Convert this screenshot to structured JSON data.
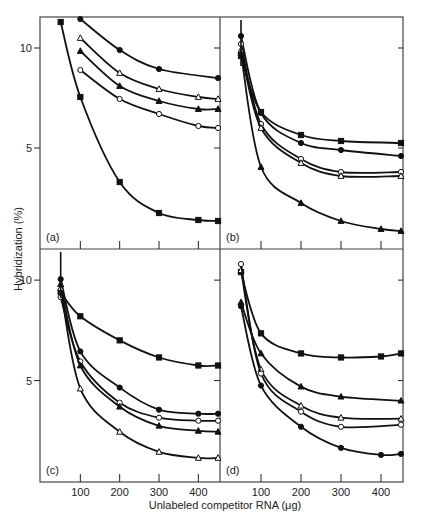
{
  "chart_data": {
    "type": "line",
    "title": "",
    "xlabel": "Unlabeled competitor  RNA (μg)",
    "ylabel": "Hybridization (%)",
    "xlim": [
      0,
      455
    ],
    "ylim": [
      0,
      11.5
    ],
    "xticks": [
      100,
      200,
      300,
      400
    ],
    "xtick_labels": [
      "100",
      "200",
      "300",
      "400"
    ],
    "yticks": [
      5,
      10
    ],
    "ytick_labels": [
      "5",
      "10"
    ],
    "grid": false,
    "legend": "none",
    "panels": [
      {
        "label": "(a)",
        "series": [
          {
            "marker": "filled-square",
            "x": [
              50,
              100,
              200,
              300,
              400,
              450
            ],
            "y": [
              11.3,
              7.55,
              3.3,
              1.75,
              1.4,
              1.35
            ]
          },
          {
            "marker": "filled-circle",
            "x": [
              100,
              200,
              300,
              450
            ],
            "y": [
              11.45,
              9.9,
              8.95,
              8.5
            ]
          },
          {
            "marker": "open-triangle",
            "x": [
              100,
              200,
              300,
              400,
              450
            ],
            "y": [
              10.5,
              8.75,
              7.95,
              7.55,
              7.45
            ]
          },
          {
            "marker": "filled-triangle",
            "x": [
              100,
              200,
              300,
              400,
              450
            ],
            "y": [
              9.85,
              8.1,
              7.35,
              6.95,
              6.95
            ]
          },
          {
            "marker": "open-circle",
            "x": [
              100,
              200,
              300,
              400,
              450
            ],
            "y": [
              8.9,
              7.45,
              6.7,
              6.1,
              6.0
            ]
          }
        ]
      },
      {
        "label": "(b)",
        "series": [
          {
            "marker": "filled-square",
            "x": [
              50,
              100,
              200,
              300,
              450
            ],
            "y": [
              9.6,
              6.8,
              5.65,
              5.35,
              5.25
            ]
          },
          {
            "marker": "filled-circle",
            "x": [
              50,
              100,
              200,
              300,
              450
            ],
            "y": [
              10.6,
              6.75,
              5.25,
              4.9,
              4.6
            ]
          },
          {
            "marker": "open-circle",
            "x": [
              50,
              100,
              200,
              300,
              450
            ],
            "y": [
              10.2,
              6.2,
              4.45,
              3.8,
              3.8
            ]
          },
          {
            "marker": "open-triangle",
            "x": [
              50,
              100,
              200,
              300,
              450
            ],
            "y": [
              9.9,
              6.0,
              4.25,
              3.6,
              3.6
            ]
          },
          {
            "marker": "filled-triangle",
            "x": [
              50,
              100,
              200,
              300,
              400,
              450
            ],
            "y": [
              9.75,
              4.05,
              2.25,
              1.35,
              0.95,
              0.85
            ]
          }
        ]
      },
      {
        "label": "(c)",
        "series": [
          {
            "marker": "filled-square",
            "x": [
              50,
              100,
              200,
              300,
              400,
              450
            ],
            "y": [
              9.4,
              8.2,
              7.0,
              6.15,
              5.75,
              5.75
            ]
          },
          {
            "marker": "filled-circle",
            "x": [
              50,
              100,
              200,
              300,
              400,
              450
            ],
            "y": [
              10.05,
              6.45,
              4.65,
              3.55,
              3.35,
              3.35
            ]
          },
          {
            "marker": "open-circle",
            "x": [
              50,
              100,
              200,
              300,
              400,
              450
            ],
            "y": [
              9.15,
              5.95,
              3.9,
              3.15,
              3.0,
              3.0
            ]
          },
          {
            "marker": "filled-triangle",
            "x": [
              50,
              100,
              200,
              300,
              400,
              450
            ],
            "y": [
              9.8,
              5.75,
              3.7,
              2.75,
              2.5,
              2.45
            ]
          },
          {
            "marker": "open-triangle",
            "x": [
              50,
              100,
              200,
              300,
              400,
              450
            ],
            "y": [
              9.6,
              4.6,
              2.45,
              1.45,
              1.15,
              1.15
            ]
          }
        ]
      },
      {
        "label": "(d)",
        "series": [
          {
            "marker": "filled-square",
            "x": [
              50,
              100,
              200,
              300,
              400,
              450
            ],
            "y": [
              10.4,
              7.35,
              6.35,
              6.15,
              6.2,
              6.35
            ]
          },
          {
            "marker": "filled-triangle",
            "x": [
              50,
              100,
              200,
              300,
              450
            ],
            "y": [
              8.9,
              6.35,
              4.7,
              4.2,
              4.0
            ]
          },
          {
            "marker": "open-triangle",
            "x": [
              50,
              100,
              200,
              300,
              450
            ],
            "y": [
              10.5,
              5.55,
              3.75,
              3.15,
              3.1
            ]
          },
          {
            "marker": "open-circle",
            "x": [
              50,
              100,
              200,
              300,
              450
            ],
            "y": [
              10.8,
              5.35,
              3.45,
              2.7,
              2.8
            ]
          },
          {
            "marker": "filled-circle",
            "x": [
              50,
              100,
              200,
              300,
              400,
              450
            ],
            "y": [
              8.7,
              4.75,
              2.7,
              1.65,
              1.3,
              1.35
            ]
          }
        ]
      }
    ]
  }
}
